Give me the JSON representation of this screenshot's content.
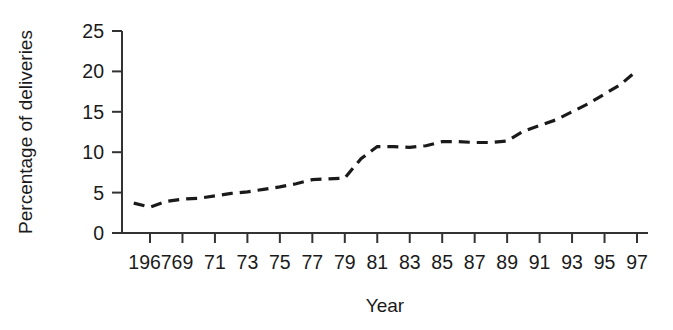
{
  "chart_data": {
    "type": "line",
    "title": "",
    "subtitle": "",
    "xlabel": "Year",
    "ylabel": "Percentage of deliveries",
    "line_style": "dashed",
    "line_color": "#1a1a1a",
    "grid": false,
    "legend": "none",
    "xlim": [
      1966,
      1997
    ],
    "ylim": [
      0,
      25
    ],
    "y_ticks": [
      0,
      5,
      10,
      15,
      20,
      25
    ],
    "y_tick_labels": [
      "0",
      "5",
      "10",
      "15",
      "20",
      "25"
    ],
    "x_ticks": [
      1967,
      1969,
      1971,
      1973,
      1975,
      1977,
      1979,
      1981,
      1983,
      1985,
      1987,
      1989,
      1991,
      1993,
      1995,
      1997
    ],
    "x_tick_labels": [
      "1967",
      "69",
      "71",
      "73",
      "75",
      "77",
      "79",
      "81",
      "83",
      "85",
      "87",
      "89",
      "91",
      "93",
      "95",
      "97"
    ],
    "x": [
      1966,
      1967,
      1968,
      1969,
      1970,
      1971,
      1972,
      1973,
      1974,
      1975,
      1976,
      1977,
      1978,
      1979,
      1980,
      1981,
      1982,
      1983,
      1984,
      1985,
      1986,
      1987,
      1988,
      1989,
      1990,
      1991,
      1992,
      1993,
      1994,
      1995,
      1996,
      1997
    ],
    "values": [
      3.7,
      3.2,
      3.9,
      4.2,
      4.3,
      4.6,
      4.9,
      5.1,
      5.4,
      5.7,
      6.1,
      6.6,
      6.7,
      6.8,
      9.2,
      10.7,
      10.7,
      10.6,
      10.8,
      11.3,
      11.3,
      11.2,
      11.2,
      11.4,
      12.6,
      13.3,
      14.0,
      15.0,
      16.0,
      17.2,
      18.4,
      20.1
    ],
    "series_name": "Percentage of deliveries"
  },
  "axes": {
    "y_axis_name": "y-axis",
    "x_axis_name": "x-axis"
  }
}
